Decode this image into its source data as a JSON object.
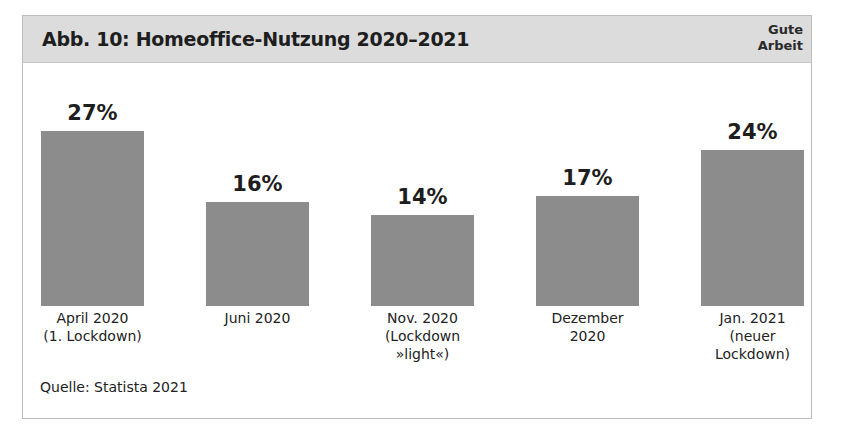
{
  "figure": {
    "title": "Abb. 10: Homeoffice-Nutzung 2020–2021",
    "badge_line1": "Gute",
    "badge_line2": "Arbeit",
    "source": "Quelle: Statista 2021"
  },
  "bars": [
    {
      "value_label": "27%",
      "category": "April 2020\n(1. Lockdown)"
    },
    {
      "value_label": "16%",
      "category": "Juni 2020"
    },
    {
      "value_label": "14%",
      "category": "Nov. 2020\n(Lockdown\n»light«)"
    },
    {
      "value_label": "17%",
      "category": "Dezember\n2020"
    },
    {
      "value_label": "24%",
      "category": "Jan. 2021\n(neuer\nLockdown)"
    }
  ],
  "colors": {
    "bar": "#8c8c8c",
    "header_bg": "#dcdcdc",
    "border": "#bdbdbd"
  },
  "chart_data": {
    "type": "bar",
    "title": "Abb. 10: Homeoffice-Nutzung 2020–2021",
    "categories": [
      "April 2020 (1. Lockdown)",
      "Juni 2020",
      "Nov. 2020 (Lockdown »light«)",
      "Dezember 2020",
      "Jan. 2021 (neuer Lockdown)"
    ],
    "values": [
      27,
      16,
      14,
      17,
      24
    ],
    "unit": "%",
    "xlabel": "",
    "ylabel": "",
    "ylim": [
      0,
      30
    ],
    "grid": false,
    "legend": null,
    "annotations": [
      "Gute Arbeit",
      "Quelle: Statista 2021"
    ]
  }
}
